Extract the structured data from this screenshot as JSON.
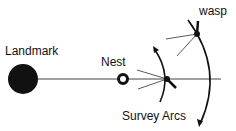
{
  "diagram": {
    "labels": {
      "landmark": "Landmark",
      "nest": "Nest",
      "wasp": "wasp",
      "survey_arcs": "Survey Arcs"
    },
    "colors": {
      "ink": "#111111",
      "background": "#ffffff"
    }
  }
}
